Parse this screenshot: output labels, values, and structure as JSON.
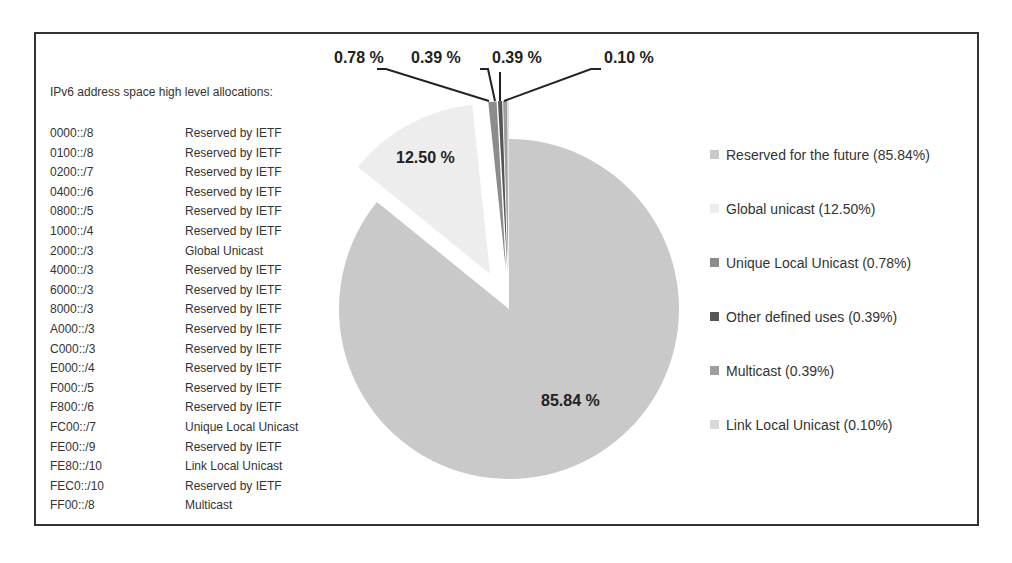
{
  "list": {
    "title": "IPv6 address space high level allocations:",
    "rows": [
      {
        "prefix": "0000::/8",
        "use": "Reserved by IETF"
      },
      {
        "prefix": "0100::/8",
        "use": "Reserved by IETF"
      },
      {
        "prefix": "0200::/7",
        "use": "Reserved by IETF"
      },
      {
        "prefix": "0400::/6",
        "use": "Reserved by IETF"
      },
      {
        "prefix": "0800::/5",
        "use": "Reserved by IETF"
      },
      {
        "prefix": "1000::/4",
        "use": "Reserved by IETF"
      },
      {
        "prefix": "2000::/3",
        "use": "Global Unicast"
      },
      {
        "prefix": "4000::/3",
        "use": "Reserved by IETF"
      },
      {
        "prefix": "6000::/3",
        "use": "Reserved by IETF"
      },
      {
        "prefix": "8000::/3",
        "use": "Reserved by IETF"
      },
      {
        "prefix": "A000::/3",
        "use": "Reserved by IETF"
      },
      {
        "prefix": "C000::/3",
        "use": "Reserved by IETF"
      },
      {
        "prefix": "E000::/4",
        "use": "Reserved by IETF"
      },
      {
        "prefix": "F000::/5",
        "use": "Reserved by IETF"
      },
      {
        "prefix": "F800::/6",
        "use": "Reserved by IETF"
      },
      {
        "prefix": "FC00::/7",
        "use": "Unique Local Unicast"
      },
      {
        "prefix": "FE00::/9",
        "use": "Reserved by IETF"
      },
      {
        "prefix": "FE80::/10",
        "use": "Link Local Unicast"
      },
      {
        "prefix": "FEC0::/10",
        "use": "Reserved by IETF"
      },
      {
        "prefix": "FF00::/8",
        "use": "Multicast"
      }
    ]
  },
  "chart_data": {
    "type": "pie",
    "title": "",
    "categories": [
      "Reserved for the future",
      "Global unicast",
      "Unique Local Unicast",
      "Other defined uses",
      "Multicast",
      "Link Local Unicast"
    ],
    "values": [
      85.84,
      12.5,
      0.78,
      0.39,
      0.39,
      0.1
    ],
    "data_labels": [
      "85.84 %",
      "12.50 %",
      "0.78 %",
      "0.39 %",
      "0.39 %",
      "0.10 %"
    ],
    "legend": [
      "Reserved for the future (85.84%)",
      "Global unicast (12.50%)",
      "Unique Local Unicast (0.78%)",
      "Other defined uses (0.39%)",
      "Multicast (0.39%)",
      "Link Local Unicast (0.10%)"
    ],
    "colors": [
      "#c9c9c9",
      "#ededed",
      "#8c8c8c",
      "#555555",
      "#9e9e9e",
      "#d9d9d9"
    ],
    "exploded": [
      false,
      true,
      true,
      true,
      true,
      true
    ],
    "legend_position": "right"
  }
}
